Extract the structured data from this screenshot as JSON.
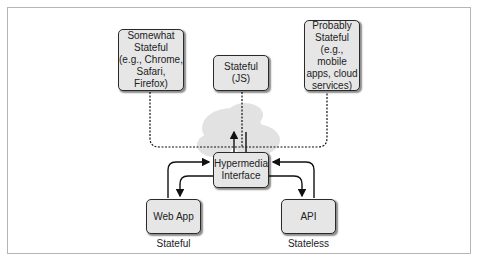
{
  "diagram": {
    "clients": [
      {
        "id": "somewhat",
        "label": "Somewhat\nStateful\n(e.g., Chrome,\nSafari, Firefox)"
      },
      {
        "id": "js",
        "label": "Stateful\n(JS)"
      },
      {
        "id": "probably",
        "label": "Probably\nStateful\n(e.g., mobile\napps, cloud\nservices)"
      }
    ],
    "hub": {
      "label": "Hypermedia\nInterface"
    },
    "servers": [
      {
        "id": "webapp",
        "label": "Web App",
        "caption": "Stateful"
      },
      {
        "id": "api",
        "label": "API",
        "caption": "Stateless"
      }
    ],
    "colors": {
      "node_fill": "#e6e6e6",
      "node_border": "#2a2a2a",
      "cloud": "#dcdcdc",
      "frame": "#b5b5b5"
    }
  }
}
